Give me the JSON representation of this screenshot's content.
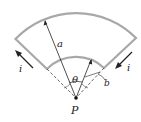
{
  "diagram": {
    "labels": {
      "outer_radius": "a",
      "inner_radius": "b",
      "angle": "θ",
      "point": "P",
      "current_left": "i",
      "current_right": "i"
    },
    "colors": {
      "wire": "#a8a8a8",
      "line": "#222222",
      "background": "#ffffff"
    }
  }
}
